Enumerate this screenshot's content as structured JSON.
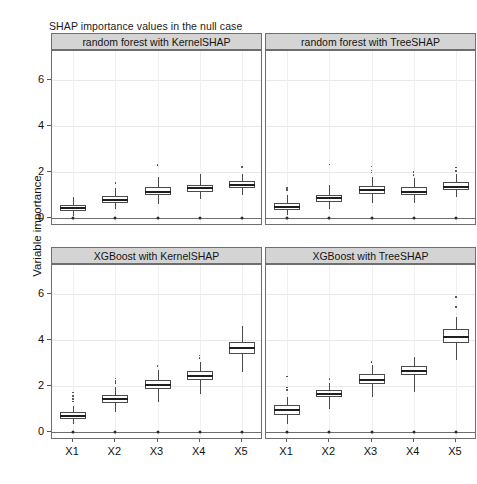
{
  "chart_data": {
    "type": "box",
    "title": "SHAP importance values in the null case",
    "xlabel": "",
    "ylabel": "Variable importance",
    "categories": [
      "X1",
      "X2",
      "X3",
      "X4",
      "X5"
    ],
    "yticks": [
      0,
      2,
      4,
      6
    ],
    "ylim": [
      0,
      7.0
    ],
    "grid": true,
    "legend": "none",
    "facets": [
      {
        "label": "random forest with KernelSHAP",
        "row": 0,
        "col": 0,
        "boxes": [
          {
            "category": "X1",
            "min": 0.1,
            "q1": 0.3,
            "median": 0.42,
            "q3": 0.55,
            "max": 0.92,
            "outliers": []
          },
          {
            "category": "X2",
            "min": 0.38,
            "q1": 0.65,
            "median": 0.8,
            "q3": 0.97,
            "max": 1.32,
            "outliers": [
              1.52
            ]
          },
          {
            "category": "X3",
            "min": 0.62,
            "q1": 1.0,
            "median": 1.15,
            "q3": 1.34,
            "max": 1.78,
            "outliers": [
              2.3
            ]
          },
          {
            "category": "X4",
            "min": 0.82,
            "q1": 1.14,
            "median": 1.3,
            "q3": 1.44,
            "max": 1.92,
            "outliers": []
          },
          {
            "category": "X5",
            "min": 1.02,
            "q1": 1.32,
            "median": 1.45,
            "q3": 1.6,
            "max": 1.9,
            "outliers": [
              2.22
            ]
          }
        ]
      },
      {
        "label": "random forest with TreeSHAP",
        "row": 0,
        "col": 1,
        "boxes": [
          {
            "category": "X1",
            "min": 0.12,
            "q1": 0.34,
            "median": 0.5,
            "q3": 0.64,
            "max": 1.0,
            "outliers": [
              1.22,
              1.3
            ]
          },
          {
            "category": "X2",
            "min": 0.4,
            "q1": 0.7,
            "median": 0.85,
            "q3": 1.02,
            "max": 1.42,
            "outliers": [
              2.32
            ]
          },
          {
            "category": "X3",
            "min": 0.64,
            "q1": 1.04,
            "median": 1.2,
            "q3": 1.38,
            "max": 1.8,
            "outliers": [
              1.98,
              2.06,
              2.24
            ]
          },
          {
            "category": "X4",
            "min": 0.66,
            "q1": 1.0,
            "median": 1.15,
            "q3": 1.34,
            "max": 1.72,
            "outliers": [
              1.86,
              2.0
            ]
          },
          {
            "category": "X5",
            "min": 0.92,
            "q1": 1.2,
            "median": 1.35,
            "q3": 1.56,
            "max": 1.92,
            "outliers": [
              2.04,
              2.2
            ]
          }
        ]
      },
      {
        "label": "XGBoost with KernelSHAP",
        "row": 1,
        "col": 0,
        "boxes": [
          {
            "category": "X1",
            "min": 0.34,
            "q1": 0.58,
            "median": 0.7,
            "q3": 0.86,
            "max": 1.12,
            "outliers": [
              1.32,
              1.44,
              1.56,
              1.72
            ]
          },
          {
            "category": "X2",
            "min": 0.88,
            "q1": 1.28,
            "median": 1.45,
            "q3": 1.62,
            "max": 1.96,
            "outliers": [
              2.14,
              2.22,
              2.32
            ]
          },
          {
            "category": "X3",
            "min": 1.32,
            "q1": 1.86,
            "median": 2.05,
            "q3": 2.28,
            "max": 2.7,
            "outliers": [
              2.86
            ]
          },
          {
            "category": "X4",
            "min": 1.66,
            "q1": 2.26,
            "median": 2.45,
            "q3": 2.66,
            "max": 3.06,
            "outliers": [
              3.22,
              3.32
            ]
          },
          {
            "category": "X5",
            "min": 2.62,
            "q1": 3.4,
            "median": 3.65,
            "q3": 3.92,
            "max": 4.6,
            "outliers": []
          }
        ]
      },
      {
        "label": "XGBoost with TreeSHAP",
        "row": 1,
        "col": 1,
        "boxes": [
          {
            "category": "X1",
            "min": 0.36,
            "q1": 0.72,
            "median": 0.95,
            "q3": 1.16,
            "max": 1.52,
            "outliers": [
              1.82,
              1.94,
              2.42
            ]
          },
          {
            "category": "X2",
            "min": 1.02,
            "q1": 1.5,
            "median": 1.65,
            "q3": 1.82,
            "max": 2.12,
            "outliers": [
              2.3
            ]
          },
          {
            "category": "X3",
            "min": 1.5,
            "q1": 2.08,
            "median": 2.25,
            "q3": 2.52,
            "max": 2.9,
            "outliers": [
              3.04
            ]
          },
          {
            "category": "X4",
            "min": 1.76,
            "q1": 2.46,
            "median": 2.65,
            "q3": 2.88,
            "max": 3.26,
            "outliers": []
          },
          {
            "category": "X5",
            "min": 3.12,
            "q1": 3.86,
            "median": 4.15,
            "q3": 4.48,
            "max": 5.0,
            "outliers": [
              5.44,
              5.86
            ]
          }
        ]
      }
    ]
  }
}
